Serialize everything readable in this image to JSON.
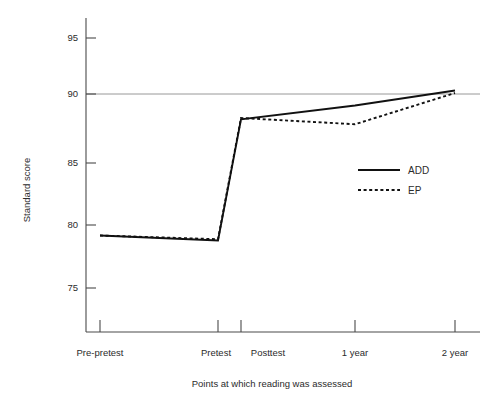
{
  "chart_data": {
    "type": "line",
    "title": "",
    "subtitle": "",
    "xlabel": "Points at which reading was assessed",
    "ylabel": "Standard score",
    "categories": [
      "Pre-pretest",
      "Pretest",
      "Posttest",
      "1 year",
      "2 year"
    ],
    "series": [
      {
        "name": "ADD",
        "style": "solid",
        "values": [
          79.2,
          78.8,
          88.5,
          89.6,
          90.8
        ]
      },
      {
        "name": "EP",
        "style": "dotted",
        "values": [
          79.2,
          78.9,
          88.6,
          88.1,
          90.6
        ]
      }
    ],
    "ylim": [
      72.5,
      96.5
    ],
    "yticks": [
      75,
      80,
      85,
      90,
      95
    ],
    "ytick_labels": [
      "75",
      "80",
      "85",
      "90",
      "95"
    ],
    "xtick_labels": [
      "Pre-pretest",
      "Pretest",
      "Posttest",
      "1 year",
      "2 year"
    ],
    "grid": true,
    "gridlines": [
      90
    ],
    "legend_position": "right-middle",
    "legend_entries": [
      "ADD",
      "EP"
    ],
    "colors": {
      "series_line": "#111111",
      "axis": "#4a4a4a",
      "gridline": "#8c8c8c",
      "text": "#2b2b2b",
      "background": "#ffffff"
    }
  },
  "axes": {
    "y_title": "Standard score",
    "x_title": "Points at which reading was assessed",
    "y_tick_95": "95",
    "y_tick_90": "90",
    "y_tick_85": "85",
    "y_tick_80": "80",
    "y_tick_75": "75",
    "x_tick_1": "Pre-pretest",
    "x_tick_2": "Pretest",
    "x_tick_3": "Posttest",
    "x_tick_4": "1 year",
    "x_tick_5": "2 year"
  },
  "legend": {
    "entry_add": "ADD",
    "entry_ep": "EP"
  }
}
